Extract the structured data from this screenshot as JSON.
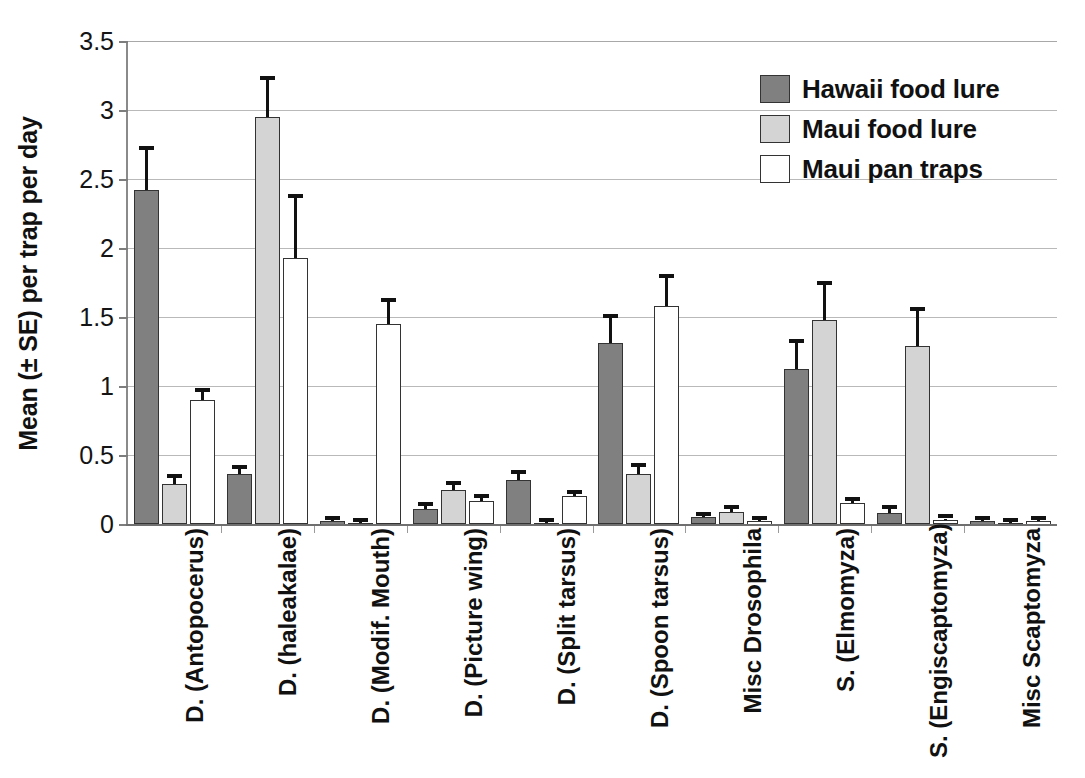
{
  "chart_data": {
    "type": "bar",
    "title": "",
    "subtitle": "",
    "xlabel": "",
    "ylabel": "Mean (± SE) per trap per day",
    "ylim": [
      0,
      3.5
    ],
    "yticks": [
      "0",
      "0.5",
      "1",
      "1.5",
      "2",
      "2.5",
      "3",
      "3.5"
    ],
    "ytick_values": [
      0,
      0.5,
      1,
      1.5,
      2,
      2.5,
      3,
      3.5
    ],
    "grid": true,
    "legend_position": "top-right",
    "categories": [
      "D. (Antopocerus)",
      "D. (haleakalae)",
      "D. (Modif. Mouth)",
      "D. (Picture wing)",
      "D. (Split tarsus)",
      "D. (Spoon tarsus)",
      "Misc Drosophila",
      "S. (Elmomyza)",
      "S. (Engiscaptomyza)",
      "Misc Scaptomyza"
    ],
    "series": [
      {
        "name": "Hawaii food lure",
        "color": "#808080",
        "values": [
          2.42,
          0.36,
          0.02,
          0.11,
          0.32,
          1.31,
          0.05,
          1.12,
          0.08,
          0.02
        ],
        "errors": [
          0.29,
          0.04,
          0.01,
          0.02,
          0.04,
          0.18,
          0.01,
          0.19,
          0.03,
          0.01
        ]
      },
      {
        "name": "Maui food lure",
        "color": "#d4d4d4",
        "values": [
          0.29,
          2.95,
          0.01,
          0.25,
          0.01,
          0.36,
          0.09,
          1.48,
          1.29,
          0.01
        ],
        "errors": [
          0.04,
          0.27,
          0.005,
          0.03,
          0.005,
          0.05,
          0.02,
          0.25,
          0.25,
          0.005
        ]
      },
      {
        "name": "Maui pan traps",
        "color": "#ffffff",
        "values": [
          0.9,
          1.93,
          1.45,
          0.17,
          0.2,
          1.58,
          0.02,
          0.15,
          0.03,
          0.02
        ],
        "errors": [
          0.06,
          0.43,
          0.16,
          0.02,
          0.02,
          0.2,
          0.01,
          0.02,
          0.01,
          0.01
        ]
      }
    ]
  },
  "legend": {
    "entries": [
      {
        "label": "Hawaii food lure",
        "swatch": "dark-gray-swatch",
        "color": "#808080"
      },
      {
        "label": "Maui food lure",
        "swatch": "light-gray-swatch",
        "color": "#d4d4d4"
      },
      {
        "label": "Maui pan traps",
        "swatch": "white-swatch",
        "color": "#ffffff"
      }
    ]
  },
  "axes": {
    "y_title": "Mean (± SE) per trap per day",
    "y_tick_labels": [
      "3.5",
      "3",
      "2.5",
      "2",
      "1.5",
      "1",
      "0.5",
      "0"
    ]
  }
}
